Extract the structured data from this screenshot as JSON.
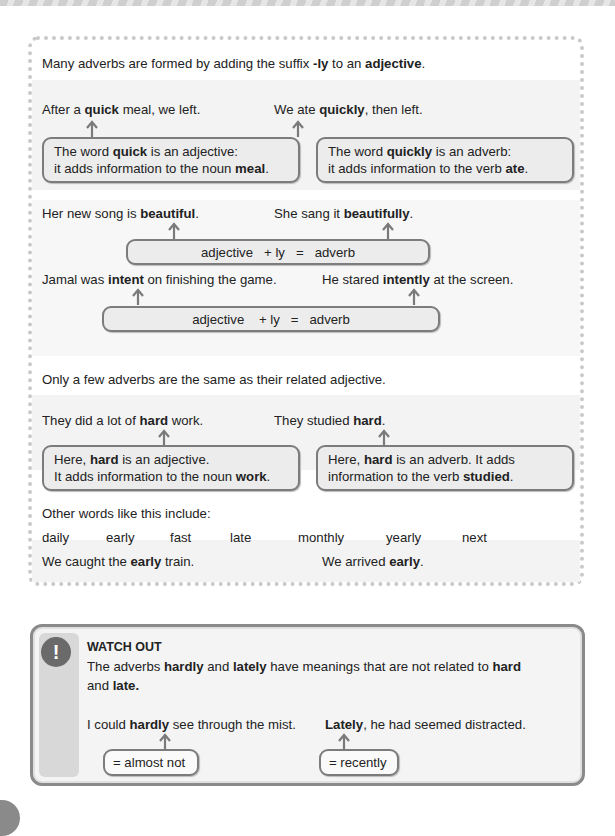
{
  "intro": {
    "pre": "Many adverbs are formed by adding the suffix ",
    "suffix": "-ly",
    "mid": " to an ",
    "term": "adjective",
    "post": "."
  },
  "example_quick": {
    "left_sentence": {
      "pre": "After a ",
      "bold": "quick",
      "post": " meal, we left."
    },
    "right_sentence": {
      "pre": "We ate ",
      "bold": "quickly",
      "post": ", then left."
    },
    "left_box": {
      "l1_pre": "The word ",
      "l1_bold": "quick",
      "l1_post": " is an adjective:",
      "l2_pre": "it adds information to the noun ",
      "l2_bold": "meal",
      "l2_post": "."
    },
    "right_box": {
      "l1_pre": "The word ",
      "l1_bold": "quickly",
      "l1_post": " is an adverb:",
      "l2_pre": "it adds information to the verb ",
      "l2_bold": "ate",
      "l2_post": "."
    }
  },
  "example_beautiful": {
    "left_sentence": {
      "pre": "Her new song is ",
      "bold": "beautiful",
      "post": "."
    },
    "right_sentence": {
      "pre": "She sang it ",
      "bold": "beautifully",
      "post": "."
    },
    "equation": {
      "a": "adjective",
      "b": "+ ly",
      "eq": "=",
      "c": "adverb"
    }
  },
  "example_intent": {
    "left_sentence": {
      "pre": "Jamal was ",
      "bold": "intent",
      "post": " on finishing the game."
    },
    "right_sentence": {
      "pre": "He stared ",
      "bold": "intently",
      "post": " at the screen."
    },
    "equation": {
      "a": "adjective",
      "b": "+ ly",
      "eq": "=",
      "c": "adverb"
    }
  },
  "same_form": {
    "heading": "Only a few adverbs are the same as their related adjective.",
    "left_sentence": {
      "pre": "They did a lot of ",
      "bold": "hard",
      "post": " work."
    },
    "right_sentence": {
      "pre": "They studied ",
      "bold": "hard",
      "post": "."
    },
    "left_box": {
      "l1_pre": "Here, ",
      "l1_bold": "hard",
      "l1_post": " is an adjective.",
      "l2_pre": "It adds information to the noun ",
      "l2_bold": "work",
      "l2_post": "."
    },
    "right_box": {
      "l1_pre": "Here, ",
      "l1_bold": "hard",
      "l1_post": " is an adverb. It adds",
      "l2_pre": "information to the verb ",
      "l2_bold": "studied",
      "l2_post": "."
    }
  },
  "other_words": {
    "label": "Other words like this include:",
    "words": [
      "daily",
      "early",
      "fast",
      "late",
      "monthly",
      "yearly",
      "next"
    ]
  },
  "early_example": {
    "left_sentence": {
      "pre": "We caught the ",
      "bold": "early",
      "post": " train."
    },
    "right_sentence": {
      "pre": "We arrived ",
      "bold": "early",
      "post": "."
    }
  },
  "watch_out": {
    "icon": "!",
    "title": "WATCH OUT",
    "body": {
      "p1": "The adverbs ",
      "b1": "hardly",
      "p2": " and ",
      "b2": "lately",
      "p3": " have meanings that are not related to ",
      "b3": "hard",
      "p4": "and ",
      "b4": "late."
    },
    "left_sentence": {
      "pre": "I could ",
      "bold": "hardly",
      "post": " see through the mist."
    },
    "right_sentence": {
      "pre": "",
      "bold": "Lately",
      "post": ", he had seemed distracted."
    },
    "left_box": "= almost not",
    "right_box": "= recently"
  }
}
